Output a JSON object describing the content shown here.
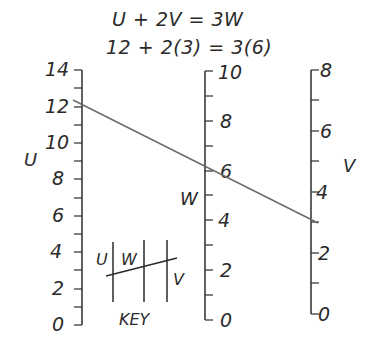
{
  "title": {
    "equation": "U + 2V = 3W",
    "example": "12 + 2(3) = 3(6)"
  },
  "axes": {
    "u": {
      "name": "U",
      "min": 0,
      "max": 14,
      "labels": [
        "0",
        "2",
        "4",
        "6",
        "8",
        "10",
        "12",
        "14"
      ]
    },
    "w": {
      "name": "W",
      "min": 0,
      "max": 10,
      "labels": [
        "0",
        "2",
        "4",
        "6",
        "8",
        "10"
      ]
    },
    "v": {
      "name": "V",
      "min": 0,
      "max": 8,
      "labels": [
        "0",
        "2",
        "4",
        "6",
        "8"
      ]
    }
  },
  "isopleth": {
    "u_value": 12,
    "v_value": 3,
    "w_value": 6
  },
  "key": {
    "title": "KEY",
    "labels": {
      "u": "U",
      "w": "W",
      "v": "V"
    }
  },
  "colors": {
    "ink": "#2a2a2a",
    "line": "#6a6a6a",
    "background": "#ffffff"
  }
}
